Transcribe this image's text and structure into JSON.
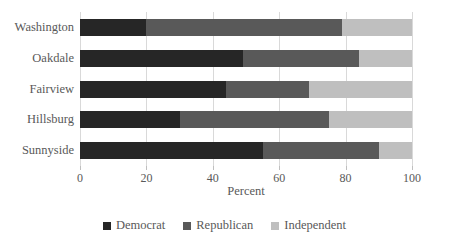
{
  "chart_data": {
    "type": "bar",
    "subtype": "stacked-horizontal-100-percent",
    "title": "",
    "subtitle": "",
    "xlabel": "Percent",
    "ylabel": "",
    "xlim": [
      0,
      100
    ],
    "xticks": [
      0,
      20,
      40,
      60,
      80,
      100
    ],
    "xtick_labels": [
      "0",
      "20",
      "40",
      "60",
      "80",
      "100"
    ],
    "grid": true,
    "grid_axis": "x",
    "legend_position": "bottom",
    "orientation": "horizontal",
    "categories": [
      "Washington",
      "Oakdale",
      "Fairview",
      "Hillsburg",
      "Sunnyside"
    ],
    "series": [
      {
        "name": "Democrat",
        "color": "#262626",
        "values": [
          20,
          49,
          44,
          30,
          55
        ]
      },
      {
        "name": "Republican",
        "color": "#595959",
        "values": [
          59,
          35,
          25,
          45,
          35
        ]
      },
      {
        "name": "Independent",
        "color": "#bfbfbf",
        "values": [
          21,
          16,
          31,
          25,
          10
        ]
      }
    ],
    "cumulative_boundaries": [
      {
        "category": "Washington",
        "stops": [
          20,
          79,
          100
        ]
      },
      {
        "category": "Oakdale",
        "stops": [
          49,
          84,
          100
        ]
      },
      {
        "category": "Fairview",
        "stops": [
          44,
          69,
          100
        ]
      },
      {
        "category": "Hillsburg",
        "stops": [
          30,
          75,
          100
        ]
      },
      {
        "category": "Sunnyside",
        "stops": [
          55,
          90,
          100
        ]
      }
    ]
  },
  "legend": {
    "items": [
      {
        "label": "Democrat",
        "color": "#262626"
      },
      {
        "label": "Republican",
        "color": "#595959"
      },
      {
        "label": "Independent",
        "color": "#bfbfbf"
      }
    ]
  },
  "style": {
    "background": "#ffffff",
    "gridline_color": "#d9d9d9",
    "text_color": "#595959",
    "tick_color": "#bfbfbf"
  }
}
